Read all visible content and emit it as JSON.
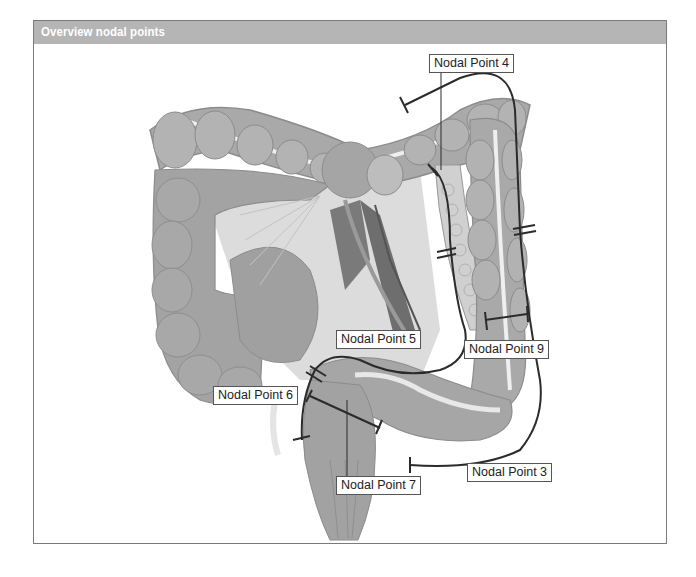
{
  "header": {
    "title": "Overview nodal points"
  },
  "labels": {
    "np4": "Nodal Point 4",
    "np5": "Nodal Point 5",
    "np9": "Nodal Point 9",
    "np6": "Nodal Point 6",
    "np7": "Nodal Point 7",
    "np3": "Nodal Point 3"
  },
  "colors": {
    "header_bg": "#b5b5b5",
    "colon_fill": "#a9a9a9",
    "colon_dark": "#8c8c8c",
    "mesentery": "#d6d6d6",
    "vessel_dark": "#6e6e6e",
    "line": "#2b2b2b"
  }
}
